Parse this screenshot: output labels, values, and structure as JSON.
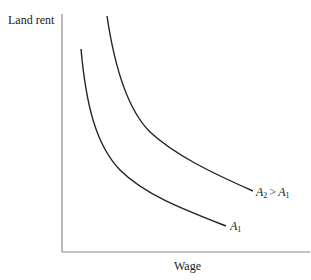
{
  "diagram": {
    "title": "",
    "axes": {
      "y_label": "Land rent",
      "x_label": "Wage"
    },
    "curves": [
      {
        "id": "A2",
        "label_var": "A",
        "label_sub": "2",
        "label_op": ">",
        "label_var2": "A",
        "label_sub2": "1",
        "description": "Higher amenity iso-utility curve (A2 > A1), lies further from origin"
      },
      {
        "id": "A1",
        "label_var": "A",
        "label_sub": "1",
        "description": "Lower amenity iso-utility curve"
      }
    ],
    "colors": {
      "axis": "#8a8a8a",
      "curve": "#222222",
      "text": "#1a1a1a"
    }
  }
}
